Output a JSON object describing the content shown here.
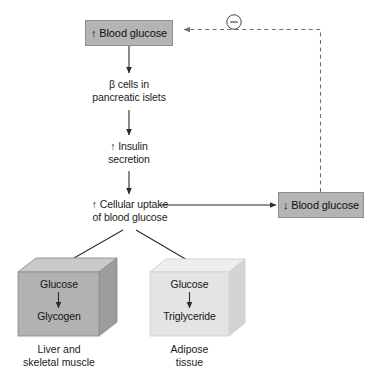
{
  "diagram": {
    "colors": {
      "box_fill": "#b4b4b4",
      "box_stroke": "#8c8c8c",
      "cube_front_left": "#b0b0b0",
      "cube_top_left": "#c9c9c9",
      "cube_side_left": "#9a9a9a",
      "cube_front_right": "#e2e2e2",
      "cube_top_right": "#efefef",
      "cube_side_right": "#d2d2d2",
      "arrow": "#2b2b2b",
      "dashed": "#6e6e6e",
      "text": "#141414"
    },
    "nodes": {
      "blood_glucose_up": {
        "label": "↑ Blood glucose",
        "shape": "rect",
        "fill": "#b4b4b4"
      },
      "beta_cells": {
        "label": "β cells in\npancreatic islets",
        "shape": "text"
      },
      "insulin_secretion": {
        "label": "↑ Insulin\nsecretion",
        "shape": "text"
      },
      "cellular_uptake": {
        "label": "↑ Cellular uptake\nof blood glucose",
        "shape": "text"
      },
      "blood_glucose_down": {
        "label": "↓ Blood glucose",
        "shape": "rect",
        "fill": "#b4b4b4"
      },
      "liver_muscle_cube": {
        "substrate": "Glucose",
        "product": "Glycogen",
        "caption": "Liver and\nskeletal muscle",
        "shape": "cube"
      },
      "adipose_cube": {
        "substrate": "Glucose",
        "product": "Triglyceride",
        "caption": "Adipose\ntissue",
        "shape": "cube"
      }
    },
    "edges": [
      {
        "from": "blood_glucose_up",
        "to": "beta_cells",
        "style": "solid-arrow",
        "direction": "down"
      },
      {
        "from": "beta_cells",
        "to": "insulin_secretion",
        "style": "solid-arrow",
        "direction": "down"
      },
      {
        "from": "insulin_secretion",
        "to": "cellular_uptake",
        "style": "solid-arrow",
        "direction": "down"
      },
      {
        "from": "cellular_uptake",
        "to": "blood_glucose_down",
        "style": "solid-arrow",
        "direction": "right"
      },
      {
        "from": "cellular_uptake",
        "to": "liver_muscle_cube",
        "style": "solid-arrow",
        "direction": "down-left"
      },
      {
        "from": "cellular_uptake",
        "to": "adipose_cube",
        "style": "solid-arrow",
        "direction": "down-right"
      },
      {
        "from": "blood_glucose_down",
        "to": "blood_glucose_up",
        "style": "dashed-arrow",
        "direction": "up-then-left",
        "annotation": "negative-feedback"
      }
    ],
    "feedback_symbol": {
      "glyph": "−",
      "name": "negative-feedback-symbol",
      "shape": "circle"
    }
  }
}
